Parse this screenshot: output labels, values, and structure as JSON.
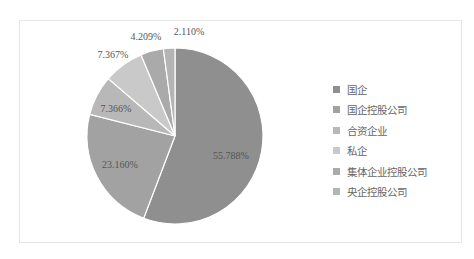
{
  "chart_data": {
    "type": "pie",
    "title": "",
    "categories": [
      "国企",
      "国企控股公司",
      "合资企业",
      "私企",
      "集体企业控股公司",
      "央企控股公司"
    ],
    "values": [
      55.788,
      23.16,
      7.366,
      7.367,
      4.209,
      2.11
    ],
    "labels": [
      "55.788%",
      "23.160%",
      "7.366%",
      "7.367%",
      "4.209%",
      "2.110%"
    ],
    "colors": [
      "#8f8f8f",
      "#a2a2a2",
      "#b8b8b8",
      "#c9c9c9",
      "#aaaaaa",
      "#b4b4b4"
    ],
    "legend_position": "right",
    "start_angle_deg": 0,
    "direction": "clockwise"
  },
  "legend": {
    "items": [
      {
        "label": "国企",
        "color": "#8f8f8f"
      },
      {
        "label": "国企控股公司",
        "color": "#a2a2a2"
      },
      {
        "label": "合资企业",
        "color": "#b8b8b8"
      },
      {
        "label": "私企",
        "color": "#c9c9c9"
      },
      {
        "label": "集体企业控股公司",
        "color": "#aaaaaa"
      },
      {
        "label": "央企控股公司",
        "color": "#b4b4b4"
      }
    ]
  }
}
